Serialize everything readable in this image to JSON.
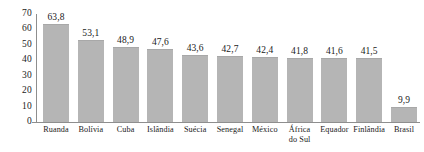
{
  "chart_data": {
    "type": "bar",
    "title": "",
    "subtitle": "",
    "xlabel": "",
    "ylabel": "",
    "ylim": [
      0,
      70
    ],
    "yticks": [
      "0",
      "10",
      "20",
      "30",
      "40",
      "50",
      "60",
      "70"
    ],
    "ytick_values": [
      0,
      10,
      20,
      30,
      40,
      50,
      60,
      70
    ],
    "grid": false,
    "legend": false,
    "decimal_separator": ",",
    "bar_color": "#b5b5b5",
    "axis_color": "#8e8e8e",
    "text_color": "#1a1a1a",
    "categories": [
      "Ruanda",
      "Bolívia",
      "Cuba",
      "Islândia",
      "Suécia",
      "Senegal",
      "México",
      "África do Sul",
      "Equador",
      "Finlândia",
      "Brasil"
    ],
    "category_lines": [
      [
        "Ruanda"
      ],
      [
        "Bolívia"
      ],
      [
        "Cuba"
      ],
      [
        "Islândia"
      ],
      [
        "Suécia"
      ],
      [
        "Senegal"
      ],
      [
        "México"
      ],
      [
        "África",
        "do Sul"
      ],
      [
        "Equador"
      ],
      [
        "Finlândia"
      ],
      [
        "Brasil"
      ]
    ],
    "values": [
      63.8,
      53.1,
      48.9,
      47.6,
      43.6,
      42.7,
      42.4,
      41.8,
      41.6,
      41.5,
      9.9
    ],
    "value_labels": [
      "63,8",
      "53,1",
      "48,9",
      "47,6",
      "43,6",
      "42,7",
      "42,4",
      "41,8",
      "41,6",
      "41,5",
      "9,9"
    ]
  }
}
